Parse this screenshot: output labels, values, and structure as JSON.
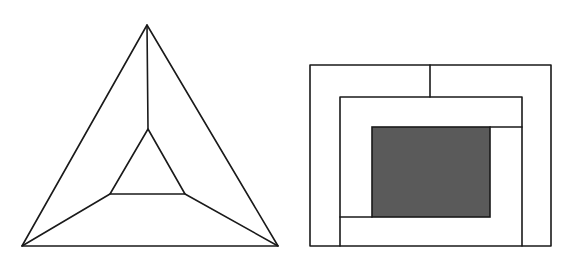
{
  "figures": [
    {
      "id": "triangle-figure",
      "shape": "nested-triangles",
      "outer": {
        "apex": [
          147,
          25
        ],
        "left": [
          22,
          246
        ],
        "right": [
          278,
          246
        ]
      },
      "inner": {
        "apex": [
          148,
          129
        ],
        "left": [
          110,
          194
        ],
        "right": [
          185,
          194
        ]
      }
    },
    {
      "id": "rectangle-figure",
      "shape": "nested-rectangles",
      "outer": {
        "x1": 310,
        "y1": 65,
        "x2": 551,
        "y2": 246
      },
      "top_divider_x": 430,
      "middle": {
        "left": 340,
        "top": 97,
        "right": 522
      },
      "shaded": {
        "x1": 372,
        "y1": 127,
        "x2": 490,
        "y2": 217,
        "fill": "#5a5a5a"
      }
    }
  ],
  "colors": {
    "line": "#1a1a1a",
    "shaded": "#5a5a5a",
    "background": "#ffffff"
  }
}
